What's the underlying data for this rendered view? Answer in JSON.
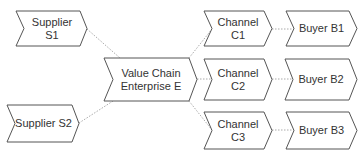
{
  "diagram": {
    "type": "value-chain",
    "style": {
      "stroke": "#555555",
      "fill": "#ffffff",
      "connector": "#aaaaaa",
      "text": "#333333"
    },
    "nodes": [
      {
        "id": "s1",
        "label": "Supplier S1",
        "x": 16,
        "y": 11,
        "w": 71,
        "h": 35
      },
      {
        "id": "s2",
        "label": "Supplier S2",
        "x": 7,
        "y": 105,
        "w": 72,
        "h": 37
      },
      {
        "id": "e",
        "label_line1": "Value Chain",
        "label_line2": "Enterprise E",
        "x": 104,
        "y": 58,
        "w": 93,
        "h": 43
      },
      {
        "id": "c1",
        "label": "Channel C1",
        "x": 204,
        "y": 11,
        "w": 68,
        "h": 35
      },
      {
        "id": "c2",
        "label": "Channel C2",
        "x": 204,
        "y": 59,
        "w": 68,
        "h": 41
      },
      {
        "id": "c3",
        "label": "Channel C3",
        "x": 204,
        "y": 112,
        "w": 68,
        "h": 37
      },
      {
        "id": "b1",
        "label": "Buyer B1",
        "x": 286,
        "y": 11,
        "w": 71,
        "h": 35
      },
      {
        "id": "b2",
        "label": "Buyer B2",
        "x": 285,
        "y": 59,
        "w": 72,
        "h": 41
      },
      {
        "id": "b3",
        "label": "Buyer B3",
        "x": 286,
        "y": 112,
        "w": 71,
        "h": 37
      }
    ],
    "edges": [
      {
        "from": "s1",
        "to": "e"
      },
      {
        "from": "s2",
        "to": "e"
      },
      {
        "from": "e",
        "to": "c1"
      },
      {
        "from": "e",
        "to": "c2"
      },
      {
        "from": "e",
        "to": "c3"
      },
      {
        "from": "c1",
        "to": "b1"
      },
      {
        "from": "c2",
        "to": "b2"
      },
      {
        "from": "c3",
        "to": "b3"
      }
    ]
  }
}
